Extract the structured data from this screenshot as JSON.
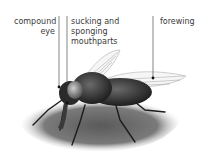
{
  "diagram": {
    "labels": {
      "compound_eye": "compound eye",
      "compound_eye_line1": "compound",
      "compound_eye_line2": "eye",
      "mouthparts_line1": "sucking and sponging",
      "mouthparts_line2": "mouthparts",
      "forewing": "forewing"
    }
  }
}
